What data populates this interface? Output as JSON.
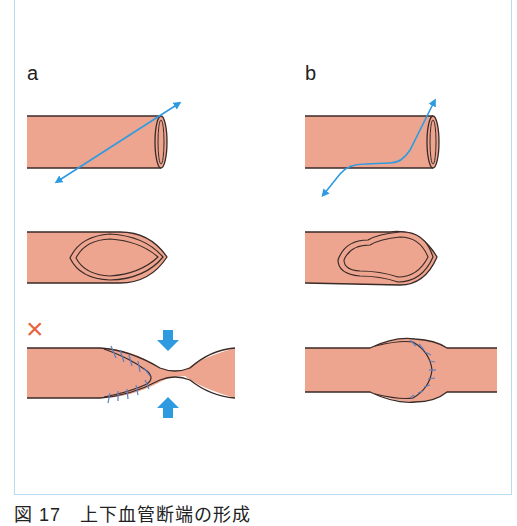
{
  "panels": {
    "a": {
      "label": "a"
    },
    "b": {
      "label": "b"
    }
  },
  "marks": {
    "wrong": "×"
  },
  "caption": "図 17　上下血管断端の形成",
  "colors": {
    "vessel": "#eda58f",
    "outline": "#3a2a28",
    "arrow": "#2e9be0",
    "suture": "#5a7fc4",
    "wrong": "#e8643c",
    "frame": "#b9dbee"
  }
}
